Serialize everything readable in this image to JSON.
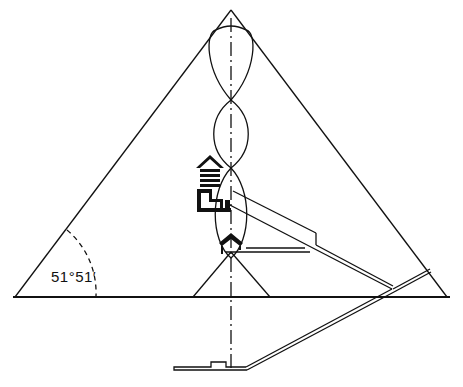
{
  "diagram": {
    "angle_label": "51°51′",
    "colors": {
      "line": "#111111",
      "background": "#ffffff"
    }
  }
}
